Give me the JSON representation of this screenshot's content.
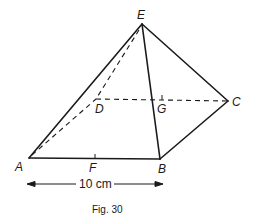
{
  "figure": {
    "caption": "Fig. 30",
    "dimension_label": "10 cm",
    "vertices": {
      "A": "A",
      "B": "B",
      "C": "C",
      "D": "D",
      "E": "E",
      "F": "F",
      "G": "G"
    },
    "colors": {
      "ink": "#1a1a1a",
      "background": "#ffffff"
    }
  }
}
